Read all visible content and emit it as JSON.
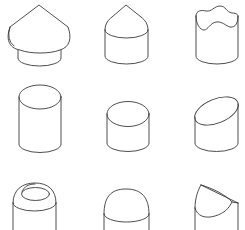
{
  "diagram": {
    "title": "",
    "style": {
      "stroke": "#3a3a3a",
      "background": "#ffffff"
    },
    "grid": {
      "rows": 3,
      "cols": 3
    },
    "shapes": [
      {
        "id": 1,
        "name": "cone-cap-on-short-cylinder",
        "row": 0,
        "col": 0
      },
      {
        "id": 2,
        "name": "cylinder-with-cone-top",
        "row": 0,
        "col": 1
      },
      {
        "id": 3,
        "name": "cylinder-with-wavy-top",
        "row": 0,
        "col": 2
      },
      {
        "id": 4,
        "name": "tall-cylinder",
        "row": 1,
        "col": 0
      },
      {
        "id": 5,
        "name": "short-cylinder",
        "row": 1,
        "col": 1
      },
      {
        "id": 6,
        "name": "cylinder-with-slanted-top",
        "row": 1,
        "col": 2
      },
      {
        "id": 7,
        "name": "cylinder-with-stepped-dome",
        "row": 2,
        "col": 0
      },
      {
        "id": 8,
        "name": "cylinder-with-dome-top",
        "row": 2,
        "col": 1
      },
      {
        "id": 9,
        "name": "cylinder-with-wedge-top",
        "row": 2,
        "col": 2
      }
    ]
  }
}
